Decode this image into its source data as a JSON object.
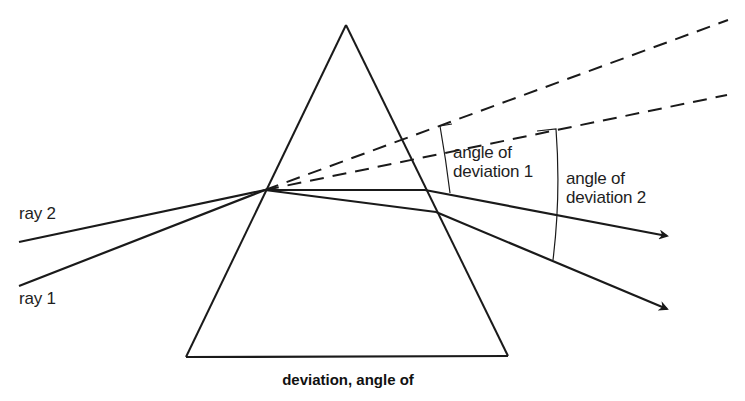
{
  "figure": {
    "caption": "deviation, angle of",
    "colors": {
      "stroke": "#1a1a1a",
      "background": "#ffffff"
    }
  },
  "labels": {
    "ray_1": "ray 2",
    "ray_2": "ray 1",
    "angle_1": {
      "line1": "angle of",
      "line2": "deviation 1"
    },
    "angle_2": {
      "line1": "angle of",
      "line2": "deviation 2"
    }
  },
  "elements": {
    "prism": "triangular prism (truncated at base)",
    "incident_rays": [
      "ray 1",
      "ray 2"
    ],
    "extension_lines": "dashed lines extending incident rays",
    "angle_brackets": [
      "angle of deviation 1",
      "angle of deviation 2"
    ],
    "arrowheads": "arrow-icon on each emergent ray"
  }
}
